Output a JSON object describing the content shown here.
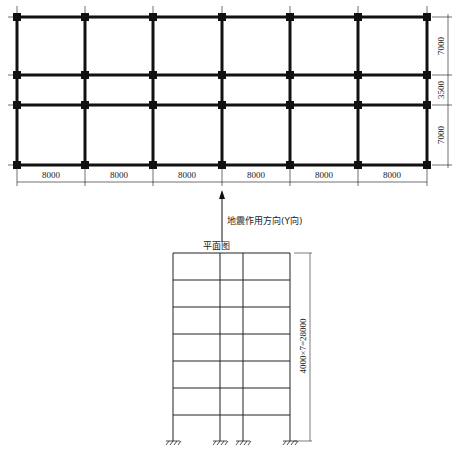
{
  "plan": {
    "title_cut": "",
    "bay_widths": [
      "8000",
      "8000",
      "8000",
      "8000",
      "8000",
      "8000"
    ],
    "span_depths": [
      "7000",
      "3500",
      "7000"
    ],
    "grid_x": [
      17,
      85,
      153,
      222,
      290,
      358,
      427
    ],
    "grid_y": [
      17,
      75,
      105,
      165
    ],
    "line_color": "#111111"
  },
  "arrow": {
    "label": "地震作用方向(Y向)"
  },
  "elevation": {
    "caption": "平面图",
    "column_x": [
      173,
      220,
      243,
      290
    ],
    "floor_y": [
      253,
      280,
      307,
      334,
      361,
      388,
      415,
      441
    ],
    "height_dimension": "4000×7=28000"
  }
}
